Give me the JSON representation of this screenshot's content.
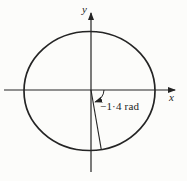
{
  "figure": {
    "axis_labels": {
      "x": "x",
      "y": "y"
    },
    "angle_label": "−1·4 rad",
    "angle_value_rad": -1.4,
    "colors": {
      "ink": "#242424",
      "paper": "#fcfcfa"
    }
  }
}
